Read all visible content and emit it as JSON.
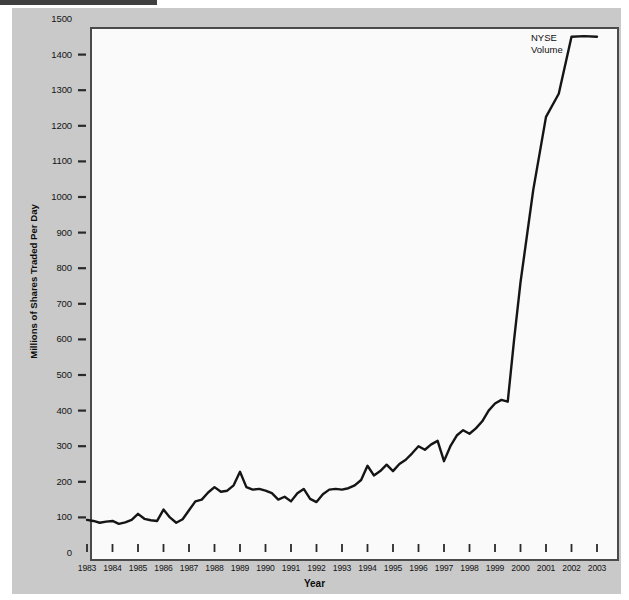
{
  "figure": {
    "background_color": "#c9c9c9",
    "plot_background_color": "#fafafa",
    "line_color": "#151515",
    "axis_color": "#4a4a4a"
  },
  "annotation": {
    "series_label": "NYSE\nVolume"
  },
  "ghost": {
    "a": "Stock Exchanges",
    "b": "Stock Exchanges",
    "c": "(Continued)"
  },
  "chart_data": {
    "type": "line",
    "title": "",
    "subtitle": "",
    "xlabel": "Year",
    "ylabel": "Millions of Shares Traded Per Day",
    "xlim": [
      1983,
      2003
    ],
    "ylim": [
      0,
      1500
    ],
    "grid": false,
    "legend_position": "inline-annotation",
    "ytick_labels": [
      "0",
      "100",
      "200",
      "300",
      "400",
      "500",
      "600",
      "700",
      "800",
      "900",
      "1000",
      "1100",
      "1200",
      "1300",
      "1400",
      "1500"
    ],
    "ytick_values": [
      0,
      100,
      200,
      300,
      400,
      500,
      600,
      700,
      800,
      900,
      1000,
      1100,
      1200,
      1300,
      1400,
      1500
    ],
    "xtick_labels": [
      "1983",
      "1984",
      "1985",
      "1986",
      "1987",
      "1988",
      "1989",
      "1990",
      "1991",
      "1992",
      "1993",
      "1994",
      "1995",
      "1996",
      "1997",
      "1998",
      "1999",
      "2000",
      "2001",
      "2002",
      "2003"
    ],
    "xtick_values": [
      1983,
      1984,
      1985,
      1986,
      1987,
      1988,
      1989,
      1990,
      1991,
      1992,
      1993,
      1994,
      1995,
      1996,
      1997,
      1998,
      1999,
      2000,
      2001,
      2002,
      2003
    ],
    "series": [
      {
        "name": "NYSE Volume",
        "x": [
          1983.0,
          1983.25,
          1983.5,
          1983.75,
          1984.0,
          1984.25,
          1984.5,
          1984.75,
          1985.0,
          1985.25,
          1985.5,
          1985.75,
          1986.0,
          1986.25,
          1986.5,
          1986.75,
          1987.0,
          1987.25,
          1987.5,
          1987.75,
          1988.0,
          1988.25,
          1988.5,
          1988.75,
          1989.0,
          1989.25,
          1989.5,
          1989.75,
          1990.0,
          1990.25,
          1990.5,
          1990.75,
          1991.0,
          1991.25,
          1991.5,
          1991.75,
          1992.0,
          1992.25,
          1992.5,
          1992.75,
          1993.0,
          1993.25,
          1993.5,
          1993.75,
          1994.0,
          1994.25,
          1994.5,
          1994.75,
          1995.0,
          1995.25,
          1995.5,
          1995.75,
          1996.0,
          1996.25,
          1996.5,
          1996.75,
          1997.0,
          1997.25,
          1997.5,
          1997.75,
          1998.0,
          1998.25,
          1998.5,
          1998.75,
          1999.0,
          1999.25,
          1999.5,
          1999.75,
          2000.0,
          2000.5,
          2001.0,
          2001.5,
          2002.0,
          2002.5,
          2003.0
        ],
        "y": [
          93,
          90,
          85,
          88,
          90,
          82,
          86,
          93,
          110,
          96,
          92,
          90,
          122,
          100,
          85,
          95,
          120,
          145,
          150,
          170,
          185,
          172,
          175,
          190,
          228,
          185,
          178,
          180,
          175,
          168,
          150,
          158,
          145,
          168,
          180,
          152,
          143,
          165,
          178,
          180,
          178,
          182,
          190,
          205,
          245,
          218,
          230,
          248,
          230,
          250,
          262,
          280,
          300,
          290,
          305,
          315,
          258,
          300,
          330,
          345,
          335,
          350,
          370,
          400,
          420,
          430,
          425,
          600,
          760,
          1020,
          1225,
          1290,
          1450,
          1452,
          1450
        ]
      }
    ]
  }
}
